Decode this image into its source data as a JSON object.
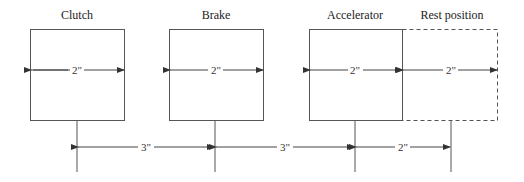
{
  "pedals": [
    {
      "label": "Clutch",
      "width_label": "2\""
    },
    {
      "label": "Brake",
      "width_label": "2\""
    },
    {
      "label": "Accelerator",
      "width_label": "2\""
    },
    {
      "label": "Rest position",
      "width_label": "2\""
    }
  ],
  "spacing": [
    {
      "label": "3\""
    },
    {
      "label": "3\""
    },
    {
      "label": "2\""
    }
  ],
  "colors": {
    "line": "#444444",
    "background": "#ffffff"
  }
}
